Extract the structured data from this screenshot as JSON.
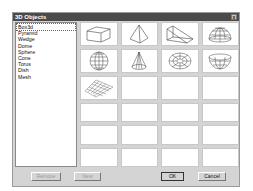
{
  "dialog": {
    "title": "3D Objects",
    "close_label": "x"
  },
  "list": {
    "items": [
      "Box3d",
      "Pyramid",
      "Wedge",
      "Dome",
      "Sphere",
      "Cone",
      "Torus",
      "Dish",
      "Mesh"
    ],
    "selected": "Box3d"
  },
  "grid": {
    "columns": 4,
    "rows": 6,
    "thumbnails": [
      "box",
      "pyramid",
      "wedge",
      "dome",
      "sphere",
      "cone",
      "torus",
      "dish",
      "mesh"
    ]
  },
  "buttons": {
    "remove": "Remove",
    "new": "New",
    "ok": "OK",
    "cancel": "Cancel"
  }
}
